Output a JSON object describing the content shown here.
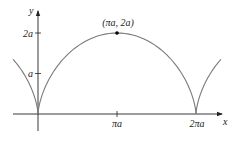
{
  "figure": {
    "type": "cycloid",
    "colors": {
      "curve": "#7a7a7a",
      "axes": "#222222",
      "point": "#000000",
      "text": "#222222"
    },
    "axes": {
      "x_label": "x",
      "y_label": "y",
      "x_ticks": [
        {
          "value_pi_a": 1,
          "label": "πa"
        },
        {
          "value_pi_a": 2,
          "label": "2πa"
        }
      ],
      "y_ticks": [
        {
          "value_a": 1,
          "label": "a"
        },
        {
          "value_a": 2,
          "label": "2a"
        }
      ]
    },
    "annotations": [
      {
        "label": "(πa, 2a)",
        "point": {
          "x": "πa",
          "y": "2a"
        }
      }
    ],
    "layout": {
      "origin_px": [
        38,
        114
      ],
      "px_per_a_x": 25.15,
      "px_per_a_y": 40.5,
      "t_ranges": [
        [
          -1.93,
          0
        ],
        [
          0,
          6.2832
        ],
        [
          6.2832,
          8.21
        ]
      ]
    }
  }
}
